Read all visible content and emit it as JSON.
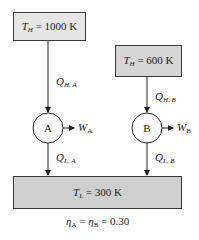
{
  "colors": {
    "hot_reservoir_fill": "#e6e6e6",
    "source_b_fill": "#d6d6d6",
    "cold_reservoir_fill": "#cfcfcf",
    "line": "#222222"
  },
  "reservoirs": {
    "hot_a": {
      "var": "T",
      "sub": "H",
      "value": "= 1000 K"
    },
    "hot_b": {
      "var": "T",
      "sub": "H",
      "value": "= 600 K"
    },
    "cold": {
      "var": "T",
      "sub": "L",
      "value": "= 300 K"
    }
  },
  "engines": {
    "a": {
      "label": "A",
      "q_in": {
        "var": "Q",
        "sub": "H, A"
      },
      "work": {
        "var": "W",
        "sub": "A"
      },
      "q_out": {
        "var": "Q",
        "sub": "L, A"
      }
    },
    "b": {
      "label": "B",
      "q_in": {
        "var": "Q",
        "sub": "H, B"
      },
      "work": {
        "var": "W",
        "sub": "B"
      },
      "q_out": {
        "var": "Q",
        "sub": "L, B"
      }
    }
  },
  "caption": {
    "eta": "η",
    "sub_a": "A",
    "sub_b": "B",
    "eq1": " = ",
    "eq2": " = 0.30"
  }
}
